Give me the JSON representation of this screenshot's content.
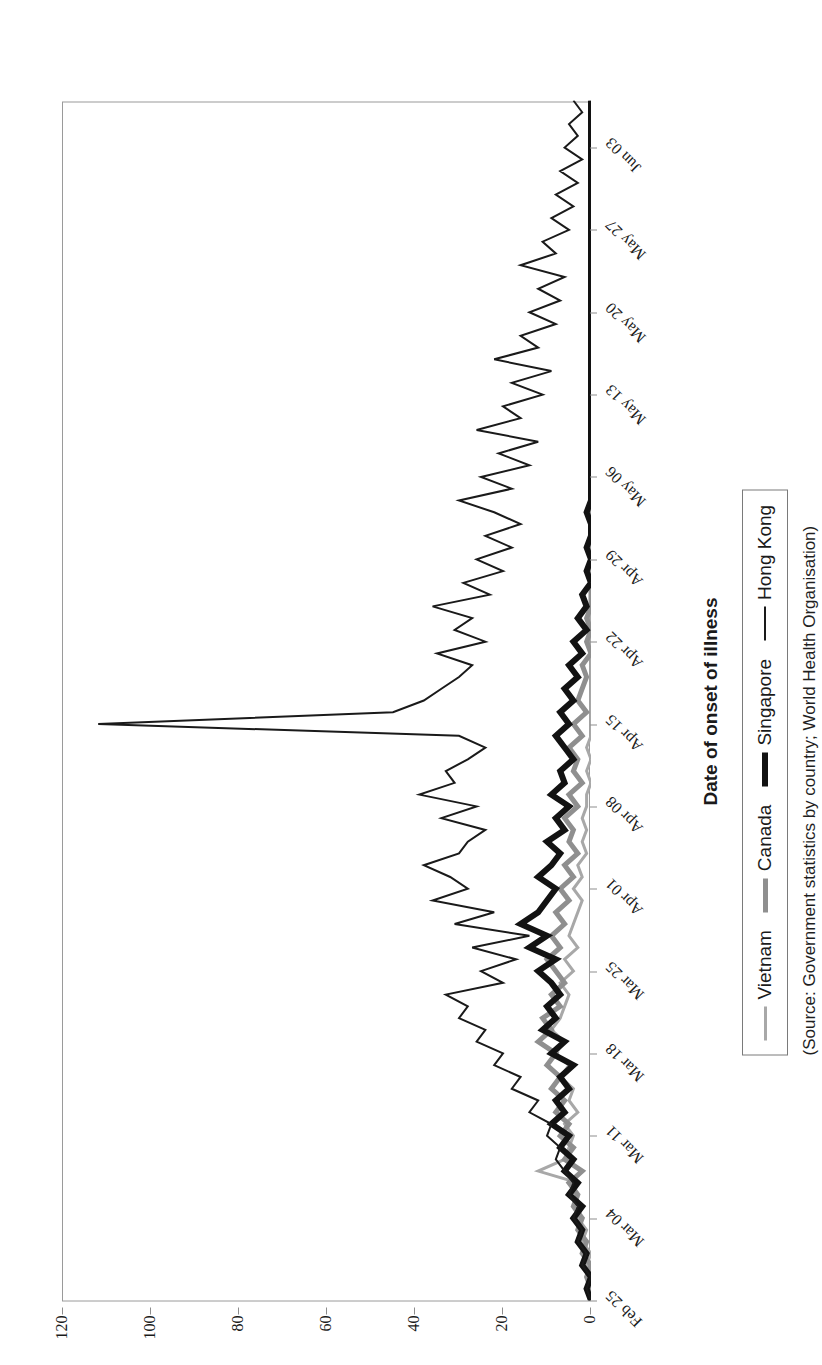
{
  "figure": {
    "source_note": "(Source: Government statistics by country; World Health Organisation)"
  },
  "axes": {
    "x_title": "Date of onset of illness",
    "y_title": "Number of cases"
  },
  "legend": {
    "position": "below-axis",
    "entries": [
      {
        "label": "Vietnam",
        "color": "#a8a8a8",
        "width": 3
      },
      {
        "label": "Canada",
        "color": "#8f8f8f",
        "width": 5
      },
      {
        "label": "Singapore",
        "color": "#121212",
        "width": 6
      },
      {
        "label": "Hong Kong",
        "color": "#1a1a1a",
        "width": 2
      }
    ]
  },
  "chart_data": {
    "type": "line",
    "title": "",
    "xlabel": "Date of onset of illness",
    "ylabel": "Number of cases",
    "ylim": [
      0,
      120
    ],
    "yticks": [
      0,
      20,
      40,
      60,
      80,
      100,
      120
    ],
    "grid": false,
    "xticklabels": [
      "Feb 25",
      "Mar 04",
      "Mar 11",
      "Mar 18",
      "Mar 25",
      "Apr 01",
      "Apr 08",
      "Apr 15",
      "Apr 22",
      "Apr 29",
      "May 06",
      "May 13",
      "May 20",
      "May 27",
      "Jun 03"
    ],
    "x_tick_interval_days": 7,
    "x_start": "Feb 25",
    "x_end": "Jun 07",
    "n_points": 103,
    "series": [
      {
        "name": "Hong Kong",
        "color": "#1a1a1a",
        "width": 2,
        "values": [
          0,
          1,
          0,
          2,
          1,
          3,
          2,
          4,
          3,
          5,
          4,
          6,
          8,
          7,
          10,
          9,
          14,
          12,
          18,
          16,
          22,
          20,
          26,
          24,
          30,
          28,
          33,
          20,
          25,
          17,
          27,
          14,
          31,
          22,
          36,
          28,
          32,
          38,
          30,
          28,
          24,
          34,
          26,
          39,
          31,
          33,
          28,
          24,
          30,
          112,
          45,
          38,
          34,
          30,
          27,
          35,
          24,
          31,
          27,
          36,
          23,
          29,
          20,
          26,
          18,
          24,
          16,
          22,
          30,
          18,
          25,
          14,
          21,
          12,
          26,
          16,
          20,
          11,
          18,
          9,
          22,
          12,
          16,
          8,
          14,
          7,
          12,
          6,
          16,
          8,
          11,
          5,
          9,
          4,
          8,
          3,
          7,
          2,
          6,
          3,
          5,
          2,
          4
        ]
      },
      {
        "name": "Singapore",
        "color": "#121212",
        "width": 6,
        "values": [
          0,
          1,
          0,
          2,
          1,
          3,
          2,
          4,
          2,
          5,
          3,
          6,
          4,
          7,
          5,
          9,
          6,
          8,
          5,
          7,
          4,
          9,
          6,
          11,
          8,
          10,
          7,
          9,
          12,
          8,
          14,
          10,
          16,
          12,
          10,
          8,
          12,
          9,
          7,
          10,
          6,
          8,
          5,
          9,
          6,
          7,
          4,
          6,
          8,
          5,
          7,
          4,
          6,
          3,
          5,
          2,
          4,
          1,
          3,
          1,
          2,
          0,
          1,
          0,
          1,
          0,
          0,
          1,
          0,
          0,
          0,
          0,
          0,
          0,
          0,
          0,
          0,
          0,
          0,
          0,
          0,
          0,
          0,
          0,
          0,
          0,
          0,
          0,
          0,
          0,
          0,
          0,
          0,
          0,
          0,
          0,
          0,
          0,
          0,
          0,
          0,
          0,
          0
        ]
      },
      {
        "name": "Canada",
        "color": "#8f8f8f",
        "width": 5,
        "values": [
          0,
          0,
          1,
          0,
          2,
          1,
          3,
          2,
          4,
          3,
          5,
          2,
          6,
          4,
          7,
          5,
          8,
          6,
          9,
          7,
          10,
          8,
          12,
          9,
          11,
          7,
          9,
          6,
          8,
          10,
          7,
          9,
          6,
          8,
          5,
          7,
          4,
          6,
          3,
          5,
          4,
          6,
          3,
          5,
          2,
          4,
          3,
          5,
          2,
          4,
          1,
          3,
          2,
          1,
          2,
          0,
          1,
          0,
          1,
          0,
          0,
          0,
          0,
          0,
          0,
          0,
          0,
          0,
          0,
          0,
          0,
          0,
          0,
          0,
          0,
          0,
          0,
          0,
          0,
          0,
          0,
          0,
          0,
          0,
          0,
          0,
          0,
          0,
          0,
          0,
          0,
          0,
          0,
          0,
          0,
          0,
          0,
          0,
          0,
          0,
          0,
          0,
          0
        ]
      },
      {
        "name": "Vietnam",
        "color": "#a8a8a8",
        "width": 3,
        "values": [
          0,
          0,
          0,
          1,
          0,
          2,
          1,
          3,
          2,
          4,
          3,
          12,
          6,
          5,
          4,
          6,
          3,
          5,
          4,
          7,
          5,
          8,
          6,
          9,
          7,
          6,
          5,
          7,
          4,
          6,
          3,
          5,
          4,
          3,
          2,
          4,
          2,
          3,
          1,
          2,
          1,
          2,
          1,
          1,
          0,
          1,
          0,
          1,
          0,
          0,
          0,
          0,
          0,
          0,
          0,
          0,
          0,
          0,
          0,
          0,
          0,
          0,
          0,
          0,
          0,
          0,
          0,
          0,
          0,
          0,
          0,
          0,
          0,
          0,
          0,
          0,
          0,
          0,
          0,
          0,
          0,
          0,
          0,
          0,
          0,
          0,
          0,
          0,
          0,
          0,
          0,
          0,
          0,
          0,
          0,
          0,
          0,
          0,
          0,
          0,
          0,
          0,
          0
        ]
      }
    ]
  }
}
